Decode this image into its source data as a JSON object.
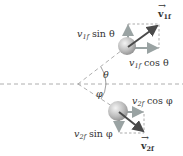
{
  "diagram": {
    "title": "",
    "particle_1": {
      "velocity_label": "v",
      "velocity_subscript": "1f",
      "y_component_label": "v",
      "y_component_sub": "1f",
      "y_component_func": " sin θ",
      "x_component_label": "v",
      "x_component_sub": "1f",
      "x_component_func": " cos θ"
    },
    "particle_2": {
      "velocity_label": "v",
      "velocity_subscript": "2f",
      "y_component_label": "v",
      "y_component_sub": "2f",
      "y_component_func": " sin φ",
      "x_component_label": "v",
      "x_component_sub": "2f",
      "x_component_func": " cos φ"
    },
    "angles": {
      "theta": "θ",
      "phi": "φ"
    },
    "colors": {
      "dashed_line": "#999999",
      "vector": "#555555",
      "component_arrow": "#9aa3a3",
      "ball": "#b8b8b8"
    }
  }
}
